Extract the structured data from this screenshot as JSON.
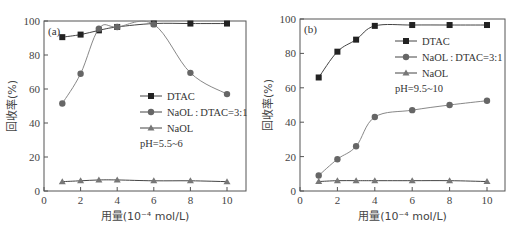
{
  "chart_data": [
    {
      "type": "line",
      "panel_label": "(a)",
      "xlabel": "用量(10⁻⁴ mol/L)",
      "ylabel": "回收率(%)",
      "xlim": [
        0,
        11
      ],
      "ylim": [
        0,
        100
      ],
      "xticks": [
        0,
        2,
        4,
        6,
        8,
        10
      ],
      "yticks": [
        0,
        20,
        40,
        60,
        80,
        100
      ],
      "annotation": "pH=5.5~6",
      "legend_position": "center-right",
      "series": [
        {
          "name": "DTAC",
          "marker": "square",
          "x": [
            1,
            2,
            3,
            4,
            6,
            8,
            10
          ],
          "values": [
            90.5,
            92,
            94.5,
            96.5,
            98.5,
            98.5,
            98.5
          ]
        },
        {
          "name": "NaOL:DTAC=3:1",
          "marker": "circle",
          "x": [
            1,
            2,
            3,
            4,
            6,
            8,
            10
          ],
          "values": [
            51.5,
            69,
            95.5,
            96.5,
            98,
            69.5,
            57
          ]
        },
        {
          "name": "NaOL",
          "marker": "triangle",
          "x": [
            1,
            2,
            3,
            4,
            6,
            8,
            10
          ],
          "values": [
            5.5,
            6,
            6.5,
            6.5,
            6,
            6,
            5.5
          ]
        }
      ]
    },
    {
      "type": "line",
      "panel_label": "(b)",
      "xlabel": "用量(10⁻⁴ mol/L)",
      "ylabel": "回收率(%)",
      "xlim": [
        0,
        11
      ],
      "ylim": [
        0,
        100
      ],
      "xticks": [
        0,
        2,
        4,
        6,
        8,
        10
      ],
      "yticks": [
        0,
        20,
        40,
        60,
        80,
        100
      ],
      "annotation": "pH=9.5~10",
      "legend_position": "upper-right",
      "series": [
        {
          "name": "DTAC",
          "marker": "square",
          "x": [
            1,
            2,
            3,
            4,
            6,
            8,
            10
          ],
          "values": [
            66,
            81,
            88,
            96,
            96.5,
            96.5,
            96.5
          ]
        },
        {
          "name": "NaOL:DTAC=3:1",
          "marker": "circle",
          "x": [
            1,
            2,
            3,
            4,
            6,
            8,
            10
          ],
          "values": [
            9,
            18.5,
            26,
            43,
            47,
            50,
            52.5
          ]
        },
        {
          "name": "NaOL",
          "marker": "triangle",
          "x": [
            1,
            2,
            3,
            4,
            6,
            8,
            10
          ],
          "values": [
            5.5,
            6,
            6,
            6,
            6,
            6,
            5.5
          ]
        }
      ]
    }
  ]
}
